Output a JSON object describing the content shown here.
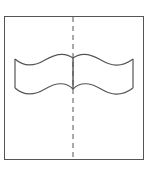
{
  "diagram": {
    "colors": {
      "stroke": "#555555",
      "background": "#ffffff"
    },
    "frame": {
      "x": 4,
      "y": 16,
      "width": 139,
      "height": 143
    },
    "fold_line": {
      "x": 73,
      "style": "dashed"
    },
    "ribbon": {
      "left_x": 15,
      "right_x": 133,
      "top_y": 58,
      "bottom_y": 88
    }
  }
}
